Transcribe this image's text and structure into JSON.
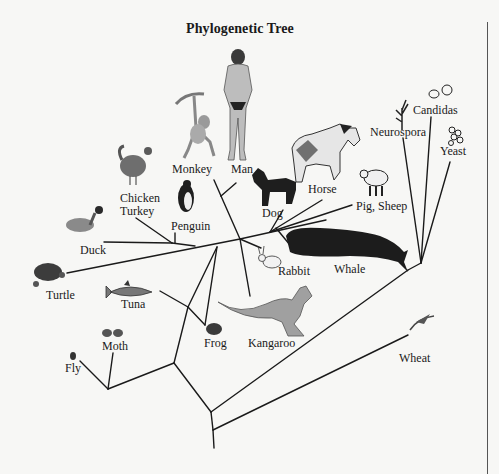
{
  "title": "Phylogenetic Tree",
  "organisms": [
    {
      "id": "man",
      "label": "Man"
    },
    {
      "id": "monkey",
      "label": "Monkey"
    },
    {
      "id": "chicken_turkey",
      "label": "Chicken\nTurkey",
      "line1": "Chicken",
      "line2": "Turkey"
    },
    {
      "id": "penguin",
      "label": "Penguin"
    },
    {
      "id": "duck",
      "label": "Duck"
    },
    {
      "id": "turtle",
      "label": "Turtle"
    },
    {
      "id": "tuna",
      "label": "Tuna"
    },
    {
      "id": "moth",
      "label": "Moth"
    },
    {
      "id": "fly",
      "label": "Fly"
    },
    {
      "id": "frog",
      "label": "Frog"
    },
    {
      "id": "kangaroo",
      "label": "Kangaroo"
    },
    {
      "id": "rabbit",
      "label": "Rabbit"
    },
    {
      "id": "dog",
      "label": "Dog"
    },
    {
      "id": "horse",
      "label": "Horse"
    },
    {
      "id": "pig_sheep",
      "label": "Pig, Sheep"
    },
    {
      "id": "whale",
      "label": "Whale"
    },
    {
      "id": "wheat",
      "label": "Wheat"
    },
    {
      "id": "neurospora",
      "label": "Neurospora"
    },
    {
      "id": "candidas",
      "label": "Candidas"
    },
    {
      "id": "yeast",
      "label": "Yeast"
    }
  ],
  "labels": {
    "man": "Man",
    "monkey": "Monkey",
    "chicken": "Chicken",
    "turkey": "Turkey",
    "penguin": "Penguin",
    "duck": "Duck",
    "turtle": "Turtle",
    "tuna": "Tuna",
    "moth": "Moth",
    "fly": "Fly",
    "frog": "Frog",
    "kangaroo": "Kangaroo",
    "rabbit": "Rabbit",
    "dog": "Dog",
    "horse": "Horse",
    "pig_sheep": "Pig, Sheep",
    "whale": "Whale",
    "wheat": "Wheat",
    "neurospora": "Neurospora",
    "candidas": "Candidas",
    "yeast": "Yeast"
  },
  "colors": {
    "background": "#f7f7f5",
    "line": "#1a1a1a",
    "illustration_dark": "#222222",
    "illustration_mid": "#7a7a7a",
    "illustration_light": "#bdbdbd"
  }
}
